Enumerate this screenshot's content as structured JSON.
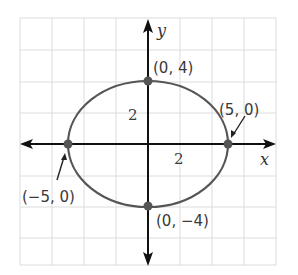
{
  "diagram": {
    "type": "ellipse-graph",
    "axes": {
      "x_label": "x",
      "y_label": "y"
    },
    "ticks": {
      "x_tick": "2",
      "y_tick": "2"
    },
    "ellipse": {
      "a": 5,
      "b": 4,
      "center": [
        0,
        0
      ]
    },
    "points": [
      {
        "label": "(0, 4)",
        "x": 0,
        "y": 4
      },
      {
        "label": "(5, 0)",
        "x": 5,
        "y": 0
      },
      {
        "label": "(−5, 0)",
        "x": -5,
        "y": 0
      },
      {
        "label": "(0, −4)",
        "x": 0,
        "y": -4
      }
    ],
    "colors": {
      "curve": "#555555",
      "axes": "#111111",
      "grid": "#dddddd",
      "points": "#555555"
    }
  }
}
